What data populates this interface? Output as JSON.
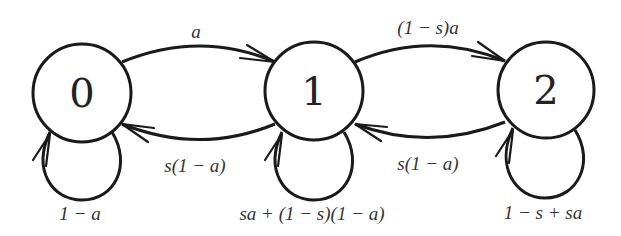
{
  "diagram": {
    "type": "markov-chain-state-diagram",
    "nodes": [
      {
        "id": "0",
        "label": "0"
      },
      {
        "id": "1",
        "label": "1"
      },
      {
        "id": "2",
        "label": "2"
      }
    ],
    "edges": [
      {
        "from": "0",
        "to": "1",
        "label": "a"
      },
      {
        "from": "1",
        "to": "0",
        "label": "s(1 − a)"
      },
      {
        "from": "1",
        "to": "2",
        "label": "(1 − s)a"
      },
      {
        "from": "2",
        "to": "1",
        "label": "s(1 − a)"
      },
      {
        "from": "0",
        "to": "0",
        "label": "1 − a"
      },
      {
        "from": "1",
        "to": "1",
        "label": "sa + (1 − s)(1 − a)"
      },
      {
        "from": "2",
        "to": "2",
        "label": "1 − s + sa"
      }
    ],
    "colors": {
      "stroke": "#1a1a1a",
      "text": "#333333",
      "background": "#ffffff"
    }
  }
}
